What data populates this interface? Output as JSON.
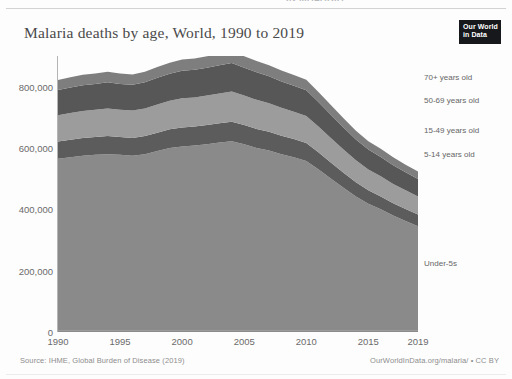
{
  "header": {
    "cropped_top_text": "IN MALARIA",
    "title": "Malaria deaths by age, World, 1990 to 2019",
    "logo_line1": "Our World",
    "logo_line2": "in Data"
  },
  "footer": {
    "source": "Source: IHME, Global Burden of Disease (2019)",
    "credit": "OurWorldInData.org/malaria/ • CC BY"
  },
  "colors": {
    "under5": "#8a8a8a",
    "age5_14": "#5c5c5c",
    "age15_49": "#9c9c9c",
    "age50_69": "#575757",
    "age70plus": "#7e7e7e",
    "axis": "#9b9b9b",
    "tick_text": "#6b6b6b",
    "title_text": "#4a4a4a",
    "logo_bg": "#17181c"
  },
  "chart_data": {
    "type": "area",
    "stacked": true,
    "title": "Malaria deaths by age, World, 1990 to 2019",
    "xlabel": "",
    "ylabel": "",
    "xlim": [
      1990,
      2019
    ],
    "ylim": [
      0,
      900000
    ],
    "grid": false,
    "legend_position": "right-inline",
    "ytick_labels": [
      "0",
      "200,000",
      "400,000",
      "600,000",
      "800,000"
    ],
    "ytick_values": [
      0,
      200000,
      400000,
      600000,
      800000
    ],
    "xtick_labels": [
      "1990",
      "1995",
      "2000",
      "2005",
      "2010",
      "2015",
      "2019"
    ],
    "xtick_values": [
      1990,
      1995,
      2000,
      2005,
      2010,
      2015,
      2019
    ],
    "x": [
      1990,
      1991,
      1992,
      1993,
      1994,
      1995,
      1996,
      1997,
      1998,
      1999,
      2000,
      2001,
      2002,
      2003,
      2004,
      2005,
      2006,
      2007,
      2008,
      2009,
      2010,
      2011,
      2012,
      2013,
      2014,
      2015,
      2016,
      2017,
      2018,
      2019
    ],
    "series": [
      {
        "name": "Under-5s",
        "label": "Under-5s",
        "color": "#8a8a8a",
        "values": [
          565000,
          570000,
          575000,
          578000,
          580000,
          578000,
          575000,
          580000,
          590000,
          600000,
          605000,
          608000,
          612000,
          618000,
          622000,
          612000,
          600000,
          592000,
          580000,
          570000,
          558000,
          530000,
          500000,
          470000,
          442000,
          418000,
          400000,
          380000,
          362000,
          345000
        ]
      },
      {
        "name": "5-14 years old",
        "label": "5-14 years old",
        "color": "#5c5c5c",
        "values": [
          56000,
          57000,
          58000,
          58000,
          59000,
          58000,
          58000,
          59000,
          60000,
          61000,
          62000,
          62000,
          63000,
          63000,
          64000,
          63000,
          62000,
          61000,
          60000,
          59000,
          58000,
          55000,
          52000,
          49000,
          46000,
          44000,
          42000,
          40000,
          39000,
          38000
        ]
      },
      {
        "name": "15-49 years old",
        "label": "15-49 years old",
        "color": "#9c9c9c",
        "values": [
          86000,
          87000,
          88000,
          89000,
          90000,
          89000,
          89000,
          90000,
          92000,
          93000,
          95000,
          95000,
          96000,
          97000,
          98000,
          96000,
          95000,
          93000,
          91000,
          89000,
          88000,
          84000,
          80000,
          76000,
          72000,
          68000,
          66000,
          63000,
          61000,
          59000
        ]
      },
      {
        "name": "50-69 years old",
        "label": "50-69 years old",
        "color": "#575757",
        "values": [
          82000,
          83000,
          84000,
          84000,
          85000,
          84000,
          84000,
          85000,
          87000,
          88000,
          90000,
          90000,
          91000,
          92000,
          93000,
          91000,
          90000,
          88000,
          86000,
          85000,
          84000,
          80000,
          76000,
          72000,
          68000,
          65000,
          63000,
          61000,
          59000,
          57000
        ]
      },
      {
        "name": "70+ years old",
        "label": "70+ years old",
        "color": "#7e7e7e",
        "values": [
          33000,
          33500,
          34000,
          34000,
          34500,
          34000,
          34000,
          34500,
          35000,
          36000,
          36500,
          36500,
          37000,
          37500,
          38000,
          37500,
          37000,
          36000,
          35500,
          35000,
          34500,
          33000,
          31500,
          30000,
          28500,
          27000,
          26500,
          25500,
          24500,
          24000
        ]
      }
    ],
    "label_anchors": [
      {
        "series": "70+ years old",
        "y_value": 830000
      },
      {
        "series": "50-69 years old",
        "y_value": 755000
      },
      {
        "series": "15-49 years old",
        "y_value": 660000
      },
      {
        "series": "5-14 years old",
        "y_value": 580000
      },
      {
        "series": "Under-5s",
        "y_value": 225000
      }
    ]
  }
}
